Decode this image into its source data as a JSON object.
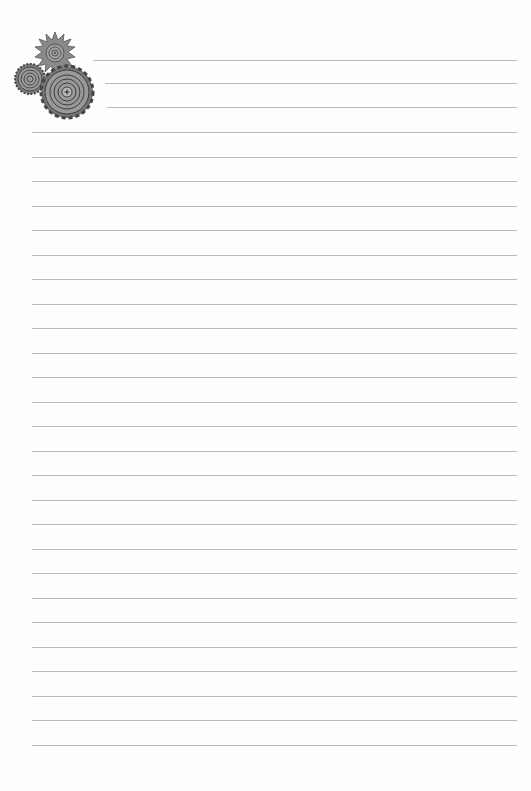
{
  "page": {
    "type": "lined-notepaper",
    "background_color": "#fefefe",
    "rule_color": "#b9b9b9",
    "decoration": "gears-icon",
    "header_rules": [
      {
        "y": 60,
        "x1": 93,
        "x2": 517
      },
      {
        "y": 83,
        "x1": 105,
        "x2": 517
      },
      {
        "y": 107,
        "x1": 107,
        "x2": 517
      }
    ],
    "body_rules": {
      "x1": 32,
      "x2": 517,
      "first_y": 132,
      "spacing": 24.5,
      "count": 26
    }
  }
}
